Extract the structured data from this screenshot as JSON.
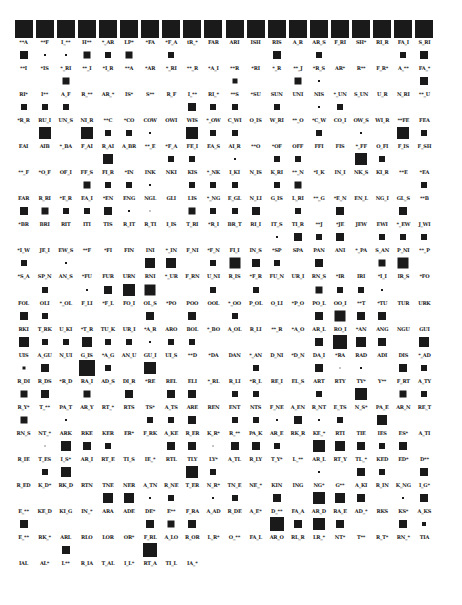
{
  "figure": {
    "type": "hinton-grid",
    "columns": 20,
    "origin_x": 23,
    "origin_y": 28,
    "col_pitch": 21.1,
    "row_pitch": 26.05,
    "square_color": "#1a1a1a"
  },
  "rows": [
    {
      "labels": [
        "**A",
        "**F",
        "I_**",
        "H**",
        "*_AR",
        "LP*",
        "*FA",
        "*F_A",
        "tR_*",
        "FAR",
        "ARI",
        "ISH",
        "RIS",
        "A_R",
        "AR_S",
        "F_RI",
        "SH*",
        "RI_R",
        "FA_I",
        "S_RI"
      ],
      "sizes": [
        18,
        18,
        18,
        18,
        18,
        18,
        18,
        18,
        18,
        18,
        18,
        18,
        18,
        18,
        18,
        18,
        18,
        18,
        18,
        18
      ]
    },
    {
      "labels": [
        "**I",
        "*IS",
        "*_RI",
        "**_I",
        "*I_R",
        "**A",
        "*AR",
        "*_RI",
        "**_R",
        "*A_I",
        "**R",
        "*RI",
        "*_R",
        "**_J",
        "*R_S",
        "AR*",
        "R**",
        "F_R*",
        "A_**",
        "FA_*"
      ],
      "sizes": [
        8,
        2,
        2,
        7,
        6,
        7,
        0,
        6,
        0,
        0,
        0,
        0,
        8,
        0,
        6,
        0,
        0,
        0,
        6,
        8
      ]
    },
    {
      "labels": [
        "RI*",
        "I**",
        "A_F",
        "R_**",
        "AR_*",
        "IS*",
        "S**",
        "R_F",
        "I_**",
        "RI_*",
        "**S",
        "*SU",
        "SUN",
        "UNI",
        "NIS",
        "*_UN",
        "S_UN",
        "U_R",
        "N_RI",
        "**_U"
      ],
      "sizes": [
        0,
        0,
        7,
        0,
        0,
        0,
        0,
        0,
        0,
        0,
        5,
        0,
        0,
        7,
        2,
        0,
        0,
        0,
        0,
        8
      ]
    },
    {
      "labels": [
        "*R_R",
        "RU_I",
        "UN_S",
        "NI_R",
        "**C",
        "*CO",
        "COW",
        "OWI",
        "WIS",
        "*_OW",
        "C_WI",
        "O_IS",
        "W_RI",
        "**_O",
        "*C_W",
        "CO_I",
        "OW_S",
        "WI_R",
        "**FE",
        "FEA"
      ],
      "sizes": [
        6,
        6,
        6,
        0,
        0,
        0,
        0,
        0,
        8,
        6,
        6,
        0,
        6,
        0,
        2,
        6,
        0,
        0,
        0,
        0
      ]
    },
    {
      "labels": [
        "EAI",
        "AIB",
        "*_BA",
        "F_AI",
        "R_AI",
        "A_BR",
        "**_E",
        "*F_A",
        "FE_I",
        "EA_S",
        "AI_R",
        "**O",
        "*OF",
        "OFF",
        "FFI",
        "FIS",
        "*_FF",
        "O_FI",
        "F_IS",
        "F_SH"
      ],
      "sizes": [
        0,
        12,
        0,
        12,
        6,
        6,
        2,
        0,
        12,
        6,
        6,
        0,
        0,
        0,
        6,
        0,
        2,
        0,
        12,
        6
      ]
    },
    {
      "labels": [
        "**_F",
        "*O_F",
        "OF_I",
        "FF_S",
        "FI_R",
        "*IN",
        "INK",
        "NKI",
        "KIS",
        "*_NK",
        "I_KI",
        "N_IS",
        "K_RI",
        "**_N",
        "*I_K",
        "IN_I",
        "NK_S",
        "KI_R",
        "**E",
        "*EA"
      ],
      "sizes": [
        0,
        0,
        0,
        0,
        10,
        0,
        0,
        6,
        6,
        0,
        2,
        0,
        6,
        6,
        0,
        0,
        12,
        6,
        0,
        0
      ]
    },
    {
      "labels": [
        "EAR",
        "R_RI",
        "*E_R",
        "EA_I",
        "*EN",
        "ENG",
        "NGL",
        "GLI",
        "LIS",
        "*_NG",
        "E_GL",
        "N_LI",
        "G_IS",
        "L_RI",
        "**_G",
        "*E_N",
        "EN_L",
        "NG_I",
        "GL_S",
        "**B"
      ],
      "sizes": [
        0,
        0,
        0,
        7,
        6,
        6,
        2,
        0,
        6,
        6,
        6,
        0,
        6,
        7,
        0,
        0,
        0,
        0,
        0,
        6
      ]
    },
    {
      "labels": [
        "*BR",
        "BRI",
        "RIT",
        "ITI",
        "TIS",
        "R_IT",
        "R_TI",
        "I_IS",
        "T_RI",
        "*R_I",
        "BR_T",
        "RI_I",
        "IT_S",
        "TI_R",
        "**J",
        "*JE",
        "JEW",
        "EWI",
        "*_EW",
        "J_WI"
      ],
      "sizes": [
        8,
        7,
        6,
        6,
        8,
        2,
        1,
        0,
        7,
        6,
        6,
        8,
        0,
        6,
        0,
        8,
        0,
        0,
        8,
        0
      ]
    },
    {
      "labels": [
        "*I_W",
        "JE_I",
        "EW_S",
        "**F",
        "*FI",
        "FIN",
        "INI",
        "*_IN",
        "F_NI",
        "*F_N",
        "FI_I",
        "IN_S",
        "*SP",
        "SPA",
        "PAN",
        "ANI",
        "*_PA",
        "S_AN",
        "P_NI",
        "**_P"
      ],
      "sizes": [
        0,
        0,
        0,
        0,
        0,
        0,
        0,
        0,
        0,
        0,
        0,
        0,
        2,
        8,
        6,
        8,
        0,
        6,
        6,
        6
      ]
    },
    {
      "labels": [
        "*S_A",
        "SP_N",
        "AN_S",
        "*FU",
        "FUR",
        "URN",
        "RNI",
        "*_UR",
        "F_RN",
        "U_NI",
        "R_IS",
        "*F_R",
        "FU_N",
        "UR_I",
        "RN_S",
        "*IR",
        "IRI",
        "*I_I",
        "IR_S",
        "*FO"
      ],
      "sizes": [
        6,
        0,
        2,
        0,
        0,
        0,
        10,
        10,
        0,
        6,
        11,
        8,
        6,
        0,
        8,
        0,
        0,
        7,
        11,
        0
      ]
    },
    {
      "labels": [
        "FOL",
        "OLI",
        "*_OL",
        "F_LI",
        "*F_L",
        "FO_I",
        "OL_S",
        "*PO",
        "POO",
        "OOL",
        "*_OO",
        "P_OL",
        "O_LI",
        "*P_O",
        "PO_L",
        "OO_I",
        "**T",
        "*TU",
        "TUR",
        "URK"
      ],
      "sizes": [
        0,
        6,
        0,
        2,
        8,
        12,
        11,
        0,
        0,
        6,
        0,
        6,
        0,
        0,
        7,
        6,
        6,
        2,
        0,
        0
      ]
    },
    {
      "labels": [
        "RKI",
        "T_RK",
        "U_KI",
        "*T_R",
        "TU_K",
        "UR_I",
        "*A_R",
        "ARO",
        "BOL",
        "*_BO",
        "A_OL",
        "R_LI",
        "**_R",
        "*A_O",
        "AR_L",
        "RO_I",
        "*AN",
        "ANG",
        "NGU",
        "GUI"
      ],
      "sizes": [
        8,
        6,
        0,
        0,
        0,
        0,
        8,
        0,
        8,
        0,
        6,
        0,
        0,
        0,
        8,
        11,
        8,
        8,
        0,
        0
      ]
    },
    {
      "labels": [
        "UIS",
        "A_GU",
        "N_UI",
        "G_IS",
        "*A_G",
        "AN_U",
        "GU_I",
        "UI_S",
        "**D",
        "*DA",
        "DAN",
        "*_AN",
        "D_NI",
        "*D_N",
        "DA_I",
        "*RA",
        "RAD",
        "ADI",
        "DIS",
        "*_AD"
      ],
      "sizes": [
        10,
        6,
        6,
        10,
        6,
        6,
        2,
        6,
        6,
        0,
        0,
        0,
        0,
        0,
        8,
        14,
        10,
        8,
        0,
        10
      ]
    },
    {
      "labels": [
        "R_DI",
        "R_DS",
        "*R_D",
        "RA_I",
        "AD_S",
        "DI_R",
        "*RE",
        "REL",
        "ELI",
        "*_RL",
        "R_LI",
        "*R_L",
        "RE_I",
        "EL_S",
        "ART",
        "RTY",
        "TY*",
        "Y**",
        "F_RT",
        "A_TY"
      ],
      "sizes": [
        3,
        8,
        0,
        16,
        6,
        0,
        12,
        0,
        0,
        0,
        0,
        6,
        0,
        0,
        8,
        1,
        2,
        0,
        8,
        6
      ]
    },
    {
      "labels": [
        "R_Y*",
        "T_**",
        "PA_T",
        "AR_Y",
        "RT_*",
        "RTS",
        "TS*",
        "A_TS",
        "ARE",
        "REN",
        "ENT",
        "NTS",
        "F_NE",
        "A_EN",
        "R_NT",
        "E_TS",
        "N_S*",
        "PA_E",
        "AR_N",
        "RE_T"
      ],
      "sizes": [
        7,
        8,
        0,
        7,
        0,
        8,
        0,
        8,
        8,
        0,
        6,
        6,
        0,
        0,
        6,
        0,
        12,
        0,
        7,
        6
      ]
    },
    {
      "labels": [
        "RN_S",
        "NT_*",
        "ARK",
        "RKE",
        "KER",
        "ER*",
        "F_RK",
        "A_KE",
        "R_ER",
        "K_R*",
        "R_**",
        "PA_K",
        "AR_E",
        "RK_R",
        "KE_*",
        "RTI",
        "TIE",
        "IES",
        "ES*",
        "A_TI"
      ],
      "sizes": [
        7,
        0,
        2,
        0,
        0,
        0,
        6,
        6,
        8,
        0,
        6,
        6,
        2,
        8,
        2,
        6,
        0,
        10,
        0,
        0
      ]
    },
    {
      "labels": [
        "R_IE",
        "T_ES",
        "I_S*",
        "AR_I",
        "RT_E",
        "TI_S",
        "IE_*",
        "RTL",
        "TLY",
        "LY*",
        "A_TL",
        "R_LY",
        "T_Y*",
        "L_**",
        "AR_L",
        "RT_Y",
        "TL_*",
        "KED",
        "ED*",
        "D**"
      ],
      "sizes": [
        0,
        1,
        10,
        8,
        6,
        0,
        0,
        8,
        8,
        1,
        8,
        8,
        6,
        0,
        12,
        10,
        8,
        6,
        8,
        0
      ]
    },
    {
      "labels": [
        "R_ED",
        "K_D*",
        "RK_D",
        "RTN",
        "TNE",
        "NER",
        "A_TN",
        "R_NE",
        "T_ER",
        "N_R*",
        "TN_E",
        "NE_*",
        "KIN",
        "ING",
        "NG*",
        "G**",
        "A_KI",
        "R_IN",
        "K_NG",
        "I_G*"
      ],
      "sizes": [
        0,
        6,
        10,
        0,
        0,
        0,
        0,
        0,
        12,
        6,
        0,
        0,
        0,
        0,
        2,
        0,
        8,
        6,
        0,
        8
      ]
    },
    {
      "labels": [
        "E_**",
        "KE_D",
        "KI_G",
        "IN_*",
        "ARA",
        "ADE",
        "DE*",
        "E**",
        "F_RA",
        "A_AD",
        "R_DE",
        "A_E*",
        "D_**",
        "FA_A",
        "AR_D",
        "RA_E",
        "AD_*",
        "RKS",
        "KS*",
        "A_KS"
      ],
      "sizes": [
        0,
        0,
        0,
        0,
        10,
        10,
        2,
        6,
        0,
        2,
        6,
        0,
        8,
        0,
        12,
        10,
        8,
        0,
        2,
        8
      ]
    },
    {
      "labels": [
        "E_**",
        "RK_*",
        "ARL",
        "RLO",
        "LOR",
        "OR*",
        "F_RL",
        "A_LO",
        "R_OR",
        "L_R*",
        "O_**",
        "FA_L",
        "AR_O",
        "RL_R",
        "LR_*",
        "NT*",
        "T**",
        "R_T*",
        "RN_*",
        "TIA"
      ],
      "sizes": [
        8,
        0,
        0,
        0,
        0,
        0,
        8,
        7,
        8,
        0,
        0,
        0,
        14,
        8,
        12,
        8,
        0,
        0,
        8,
        4
      ]
    },
    {
      "labels": [
        "IAL",
        "AL*",
        "L**",
        "R_IA",
        "T_AL",
        "I_L*",
        "RT_A",
        "TI_L",
        "IA_*"
      ],
      "sizes": [
        0,
        0,
        8,
        0,
        0,
        0,
        14,
        0,
        0
      ]
    }
  ]
}
